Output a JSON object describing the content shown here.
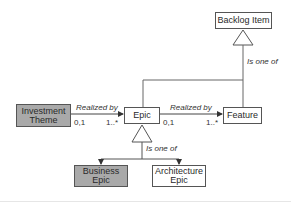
{
  "diagram": {
    "nodes": {
      "backlog_item": {
        "label": "Backlog Item",
        "fill": "#ffffff"
      },
      "investment_theme": {
        "label_line1": "Investment",
        "label_line2": "Theme",
        "fill": "#a9a9a9"
      },
      "epic": {
        "label": "Epic",
        "fill": "#ffffff"
      },
      "feature": {
        "label": "Feature",
        "fill": "#ffffff"
      },
      "business_epic": {
        "label_line1": "Business",
        "label_line2": "Epic",
        "fill": "#a9a9a9"
      },
      "architecture_epic": {
        "label_line1": "Architecture",
        "label_line2": "Epic",
        "fill": "#ffffff"
      }
    },
    "edges": {
      "theme_to_epic": {
        "label": "Realized by",
        "source_mult": "0,1",
        "target_mult": "1..*"
      },
      "epic_to_feature": {
        "label": "Realized by",
        "source_mult": "0,1",
        "target_mult": "1..*"
      },
      "backlog_generalization": {
        "label": "Is one of"
      },
      "epic_generalization": {
        "label": "Is one of"
      }
    }
  }
}
